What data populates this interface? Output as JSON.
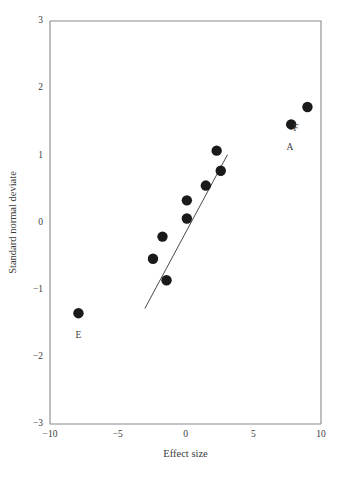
{
  "chart_data": {
    "type": "scatter",
    "title": "",
    "xlabel": "Effect size",
    "ylabel": "Standard normal deviate",
    "xlim": [
      -10,
      10
    ],
    "ylim": [
      -3,
      3
    ],
    "xticks": [
      -10,
      -5,
      0,
      5,
      10
    ],
    "yticks": [
      -3,
      -2,
      -1,
      0,
      1,
      2,
      3
    ],
    "xtick_labels": [
      "−10",
      "−5",
      "0",
      "5",
      "10"
    ],
    "ytick_labels": [
      "−3",
      "−2",
      "−1",
      "0",
      "1",
      "2",
      "3"
    ],
    "grid": false,
    "legend": "none",
    "points": [
      {
        "x": -7.9,
        "y": -1.35,
        "label": "E",
        "label_dx": 0.0,
        "label_dy": -0.33
      },
      {
        "x": -1.4,
        "y": -0.86,
        "label": "",
        "label_dx": 0,
        "label_dy": 0
      },
      {
        "x": -2.4,
        "y": -0.54,
        "label": "",
        "label_dx": 0,
        "label_dy": 0
      },
      {
        "x": -1.7,
        "y": -0.21,
        "label": "",
        "label_dx": 0,
        "label_dy": 0
      },
      {
        "x": 0.1,
        "y": 0.06,
        "label": "",
        "label_dx": 0,
        "label_dy": 0
      },
      {
        "x": 0.1,
        "y": 0.33,
        "label": "",
        "label_dx": 0,
        "label_dy": 0
      },
      {
        "x": 1.5,
        "y": 0.55,
        "label": "",
        "label_dx": 0,
        "label_dy": 0
      },
      {
        "x": 2.6,
        "y": 0.77,
        "label": "",
        "label_dx": 0,
        "label_dy": 0
      },
      {
        "x": 2.3,
        "y": 1.07,
        "label": "",
        "label_dx": 0,
        "label_dy": 0
      },
      {
        "x": 7.8,
        "y": 1.46,
        "label": "A",
        "label_dx": -0.1,
        "label_dy": -0.35
      },
      {
        "x": 9.0,
        "y": 1.72,
        "label": "F",
        "label_dx": -0.85,
        "label_dy": -0.33
      }
    ],
    "fit_line": {
      "x0": -3.0,
      "y0": -1.28,
      "x1": 3.1,
      "y1": 1.01
    },
    "point_radius_px": 5.2,
    "colors": {
      "point": "#1a1a1a",
      "line": "#4a4a4a",
      "axis": "#8a8a8a",
      "text": "#3b3b3b",
      "background": "#ffffff"
    }
  }
}
